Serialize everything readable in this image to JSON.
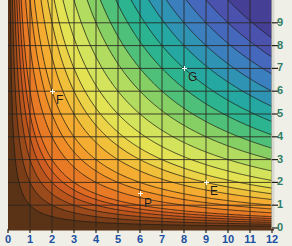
{
  "chart_data": {
    "type": "heatmap",
    "title": "",
    "subtitle": "",
    "xlabel": "",
    "ylabel": "",
    "xlim": [
      0,
      12
    ],
    "ylim": [
      0,
      10
    ],
    "grid": true,
    "legend_position": "none",
    "xticks": [
      0,
      1,
      2,
      3,
      4,
      5,
      6,
      7,
      8,
      9,
      10,
      11,
      12
    ],
    "xticklabels": [
      "0",
      "1",
      "2",
      "3",
      "4",
      "5",
      "6",
      "7",
      "8",
      "9",
      "10",
      "11",
      "12"
    ],
    "yticks": [
      0,
      1,
      2,
      3,
      4,
      5,
      6,
      7,
      8,
      9
    ],
    "yticklabels": [
      "0",
      "1",
      "2",
      "3",
      "4",
      "5",
      "6",
      "7",
      "8",
      "9"
    ],
    "xtick_color": "#1b4fa0",
    "ytick_color": "#2f7d63",
    "yaxis_side": "right",
    "contour_levels": [
      1,
      2,
      3,
      4,
      5,
      6,
      8,
      10,
      12,
      15,
      18,
      21,
      25,
      30,
      36,
      42,
      49,
      56,
      64,
      72,
      81,
      90,
      100
    ],
    "colors": [
      "#5a3317",
      "#7a3d18",
      "#9b4a1b",
      "#b9541d",
      "#cf5d22",
      "#e06a22",
      "#e87a25",
      "#ef8c28",
      "#f39c2b",
      "#f4ad31",
      "#f1c03a",
      "#ebd246",
      "#e3e253",
      "#d3e45c",
      "#b2dc5f",
      "#86cf64",
      "#4fc07a",
      "#2bb48f",
      "#25a8a2",
      "#2f93b4",
      "#3c7fbe",
      "#4668bc",
      "#4a52ad",
      "#453f95",
      "#3b3279",
      "#332a63"
    ],
    "annotations": [
      {
        "label": "F",
        "x": 2.0,
        "y": 6.0,
        "marker": "cross-white"
      },
      {
        "label": "G",
        "x": 8.0,
        "y": 7.0,
        "marker": "cross-white"
      },
      {
        "label": "E",
        "x": 9.0,
        "y": 2.0,
        "marker": "cross-white"
      },
      {
        "label": "P",
        "x": 6.0,
        "y": 1.5,
        "marker": "cross-white"
      }
    ]
  },
  "axes": {
    "x": {
      "ticks": [
        {
          "value": 0,
          "label": "0"
        },
        {
          "value": 1,
          "label": "1"
        },
        {
          "value": 2,
          "label": "2"
        },
        {
          "value": 3,
          "label": "3"
        },
        {
          "value": 4,
          "label": "4"
        },
        {
          "value": 5,
          "label": "5"
        },
        {
          "value": 6,
          "label": "6"
        },
        {
          "value": 7,
          "label": "7"
        },
        {
          "value": 8,
          "label": "8"
        },
        {
          "value": 9,
          "label": "9"
        },
        {
          "value": 10,
          "label": "10"
        },
        {
          "value": 11,
          "label": "11"
        },
        {
          "value": 12,
          "label": "12"
        }
      ]
    },
    "y": {
      "ticks": [
        {
          "value": 0,
          "label": "0"
        },
        {
          "value": 1,
          "label": "1"
        },
        {
          "value": 2,
          "label": "2"
        },
        {
          "value": 3,
          "label": "3"
        },
        {
          "value": 4,
          "label": "4"
        },
        {
          "value": 5,
          "label": "5"
        },
        {
          "value": 6,
          "label": "6"
        },
        {
          "value": 7,
          "label": "7"
        },
        {
          "value": 8,
          "label": "8"
        },
        {
          "value": 9,
          "label": "9"
        }
      ]
    }
  },
  "points": [
    {
      "label": "F",
      "x": 2.0,
      "y": 6.0
    },
    {
      "label": "G",
      "x": 8.0,
      "y": 7.0
    },
    {
      "label": "E",
      "x": 9.0,
      "y": 2.0
    },
    {
      "label": "P",
      "x": 6.0,
      "y": 1.5
    }
  ]
}
